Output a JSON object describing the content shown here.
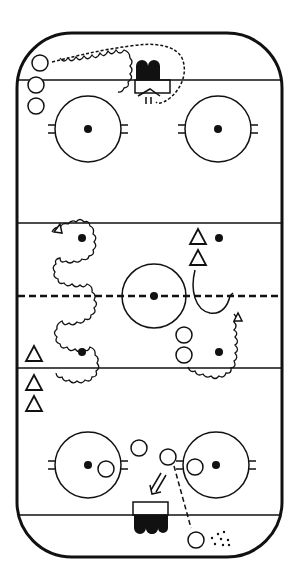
{
  "diagram": {
    "type": "hockey-drill",
    "colors": {
      "ink": "#111111",
      "background": "#ffffff"
    },
    "rink": {
      "x": 17,
      "y": 33,
      "width": 265,
      "height": 524,
      "corner_radius": 55,
      "goal_lines_y": [
        80,
        515
      ],
      "blue_lines_y": [
        223,
        368
      ],
      "center_line_y": 296,
      "center_circle": {
        "cx": 154,
        "cy": 296,
        "r": 32
      },
      "faceoff_circles": [
        {
          "cx": 88,
          "cy": 129,
          "r": 33
        },
        {
          "cx": 218,
          "cy": 129,
          "r": 33
        },
        {
          "cx": 88,
          "cy": 465,
          "r": 33
        },
        {
          "cx": 216,
          "cy": 465,
          "r": 33
        }
      ],
      "neutral_dots": [
        {
          "cx": 82,
          "cy": 238
        },
        {
          "cx": 219,
          "cy": 238
        },
        {
          "cx": 82,
          "cy": 352
        },
        {
          "cx": 219,
          "cy": 352
        }
      ],
      "nets": [
        {
          "label": "top-net",
          "x": 137,
          "y": 56,
          "mouth": "down"
        },
        {
          "label": "bottom-net",
          "x": 134,
          "y": 502,
          "mouth": "up"
        }
      ]
    },
    "players": {
      "circles": [
        {
          "cx": 40,
          "cy": 63
        },
        {
          "cx": 36,
          "cy": 85
        },
        {
          "cx": 36,
          "cy": 106
        },
        {
          "cx": 184,
          "cy": 335
        },
        {
          "cx": 184,
          "cy": 355
        },
        {
          "cx": 139,
          "cy": 448
        },
        {
          "cx": 168,
          "cy": 457
        },
        {
          "cx": 106,
          "cy": 469
        },
        {
          "cx": 195,
          "cy": 467
        },
        {
          "cx": 196,
          "cy": 540
        }
      ],
      "triangles": [
        {
          "cx": 198,
          "cy": 237
        },
        {
          "cx": 198,
          "cy": 258
        },
        {
          "cx": 34,
          "cy": 354
        },
        {
          "cx": 34,
          "cy": 383
        },
        {
          "cx": 34,
          "cy": 404
        }
      ]
    },
    "annotations": {
      "pucks": [
        {
          "cx": 222,
          "cy": 541
        }
      ],
      "pass_line": {
        "from": [
          174,
          466
        ],
        "to": [
          191,
          528
        ]
      },
      "shot_arrow": {
        "at": [
          160,
          488
        ],
        "direction": "down-left"
      }
    }
  }
}
